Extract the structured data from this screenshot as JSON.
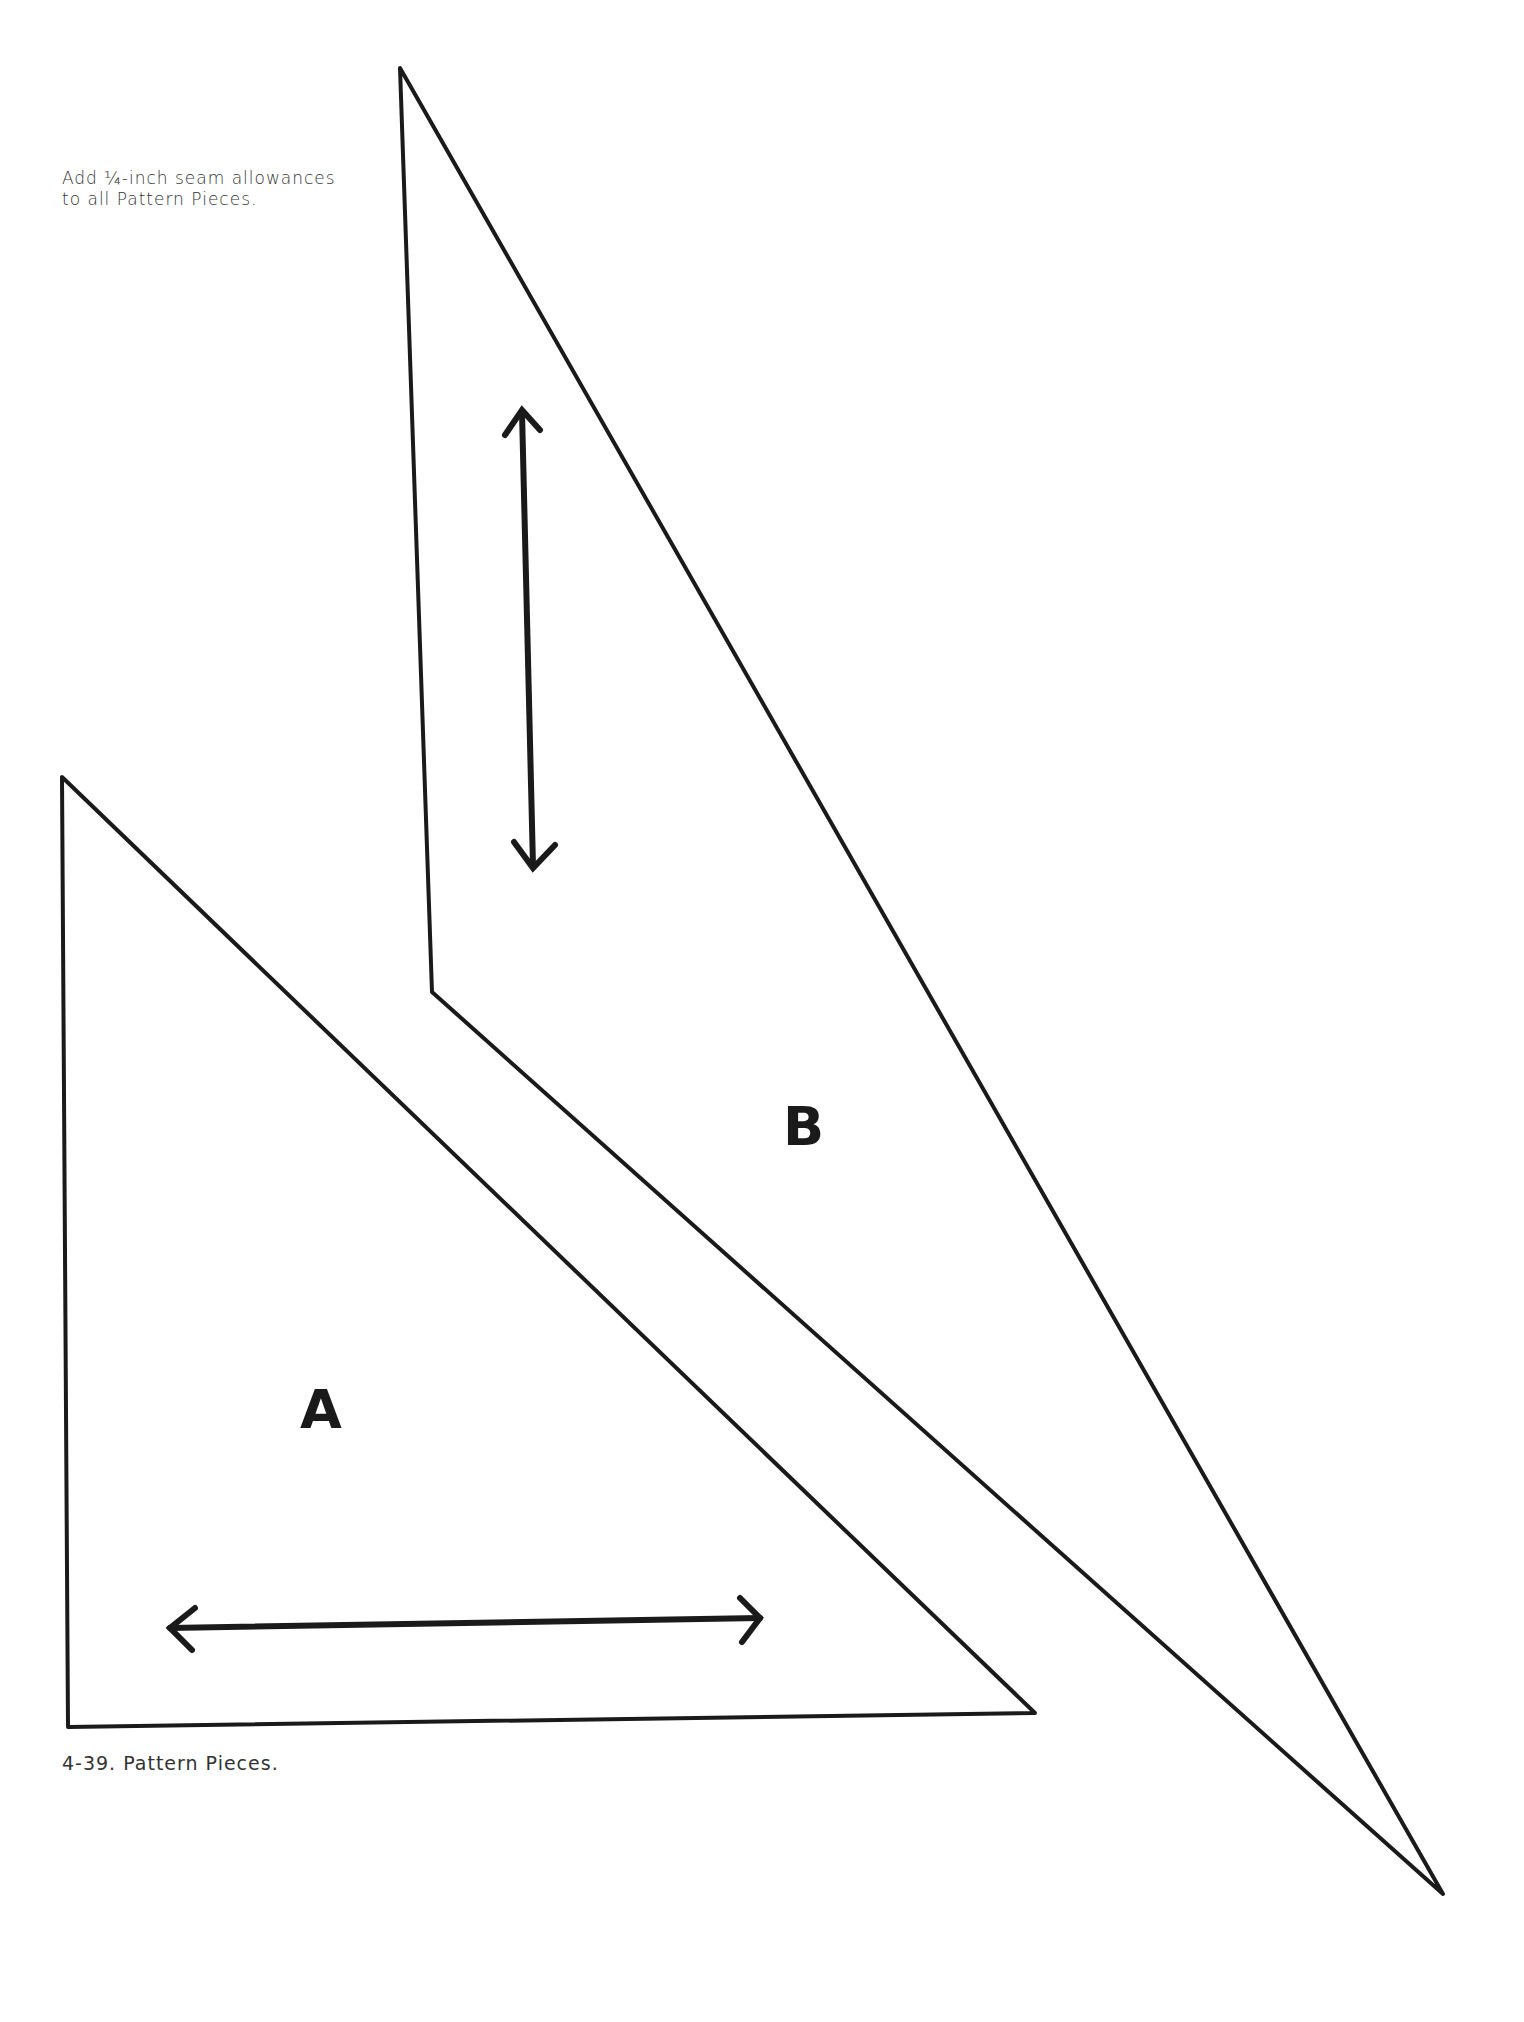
{
  "note": {
    "line1": "Add ¼-inch seam allowances",
    "line2": "to all Pattern Pieces."
  },
  "caption": "4-39. Pattern Pieces.",
  "pieces": [
    {
      "label": "A",
      "shape": "right triangle",
      "grainline": "horizontal double-headed arrow"
    },
    {
      "label": "B",
      "shape": "long narrow quadrilateral",
      "grainline": "vertical double-headed arrow"
    }
  ],
  "colors": {
    "line": "#1a1a1a",
    "background": "#ffffff"
  }
}
